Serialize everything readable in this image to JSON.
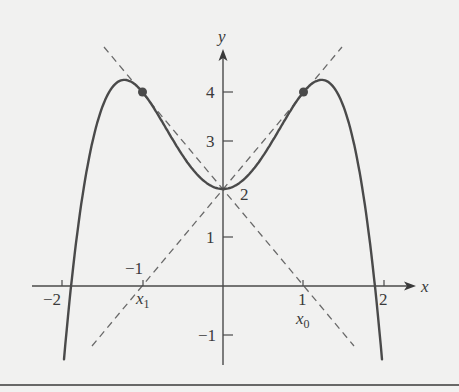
{
  "colors": {
    "background": "#f1f1f0",
    "curve": "#4a4a4a",
    "axis": "#4a4a4a",
    "dashed": "#6a6a6a",
    "point": "#4a4a4a",
    "rule": "#3a3a3a"
  },
  "axes": {
    "x_label": "x",
    "y_label": "y",
    "x_ticks": [
      {
        "value": -2,
        "label": "−2"
      },
      {
        "value": -1,
        "label": "−1"
      },
      {
        "value": 1,
        "label": "1"
      },
      {
        "value": 2,
        "label": "2"
      }
    ],
    "y_ticks": [
      {
        "value": -1,
        "label": "−1"
      },
      {
        "value": 1,
        "label": "1"
      },
      {
        "value": 2,
        "label": "2"
      },
      {
        "value": 3,
        "label": "3"
      },
      {
        "value": 4,
        "label": "4"
      }
    ]
  },
  "annotations": {
    "x1_main": "x",
    "x1_sub": "1",
    "x0_main": "x",
    "x0_sub": "0"
  },
  "chart_data": {
    "type": "line",
    "title": "",
    "xlabel": "x",
    "ylabel": "y",
    "xlim": [
      -2.4,
      2.4
    ],
    "ylim": [
      -1.6,
      4.9
    ],
    "grid": false,
    "series": [
      {
        "name": "f(x) = 2 + 3x^2 - x^4",
        "style": "solid",
        "x": [
          -1.98,
          -1.9,
          -1.8,
          -1.6,
          -1.4,
          -1.22,
          -1.0,
          -0.8,
          -0.6,
          -0.4,
          -0.2,
          0,
          0.2,
          0.4,
          0.6,
          0.8,
          1.0,
          1.22,
          1.4,
          1.6,
          1.8,
          1.9,
          1.98
        ],
        "y": [
          -1.61,
          -0.19,
          1.22,
          3.13,
          4.04,
          4.25,
          4.0,
          3.51,
          2.95,
          2.45,
          2.12,
          2.0,
          2.12,
          2.45,
          2.95,
          3.51,
          4.0,
          4.25,
          4.04,
          3.13,
          1.22,
          -0.19,
          -1.61
        ]
      },
      {
        "name": "tangent at x=1 (through (-1,0) and (1,4))",
        "style": "dashed",
        "x": [
          -1.6,
          1.5
        ],
        "y": [
          -1.2,
          5.0
        ]
      },
      {
        "name": "tangent at x=-1 (through (1,0) and (-1,4))",
        "style": "dashed",
        "x": [
          -1.5,
          1.6
        ],
        "y": [
          5.0,
          -1.2
        ]
      }
    ],
    "points": [
      {
        "x": -1,
        "y": 4,
        "marker": "filled-circle"
      },
      {
        "x": 1,
        "y": 4,
        "marker": "filled-circle"
      }
    ],
    "annotations": [
      {
        "text": "2",
        "x": 0,
        "y": 2,
        "note": "y-intercept label"
      },
      {
        "text": "x1",
        "x": -1,
        "y": 0,
        "note": "below x-axis at -1"
      },
      {
        "text": "x0",
        "x": 1,
        "y": 0,
        "note": "below x-axis at 1"
      }
    ]
  }
}
